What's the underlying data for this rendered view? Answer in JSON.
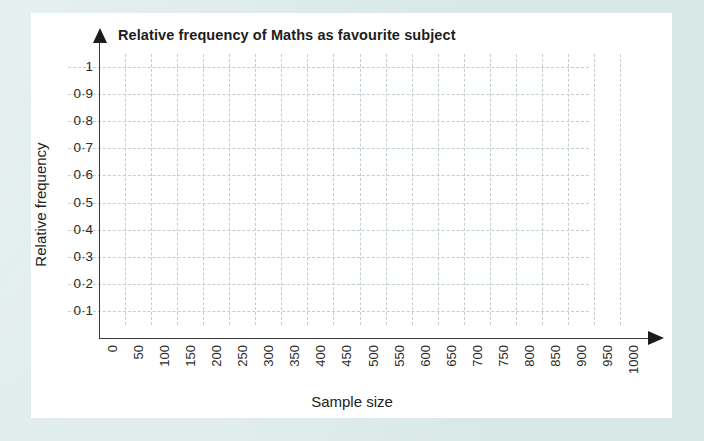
{
  "canvas": {
    "width": 704,
    "height": 441,
    "backdrop_color": "#d7e8e6",
    "card_color": "#ffffff"
  },
  "chart_data": {
    "type": "line",
    "title": "Relative frequency of Maths as favourite subject",
    "xlabel": "Sample size",
    "ylabel": "Relative frequency",
    "x": [],
    "values": [],
    "series": [],
    "xlim": [
      0,
      1000
    ],
    "ylim": [
      0,
      1
    ],
    "xticks": [
      0,
      50,
      100,
      150,
      200,
      250,
      300,
      350,
      400,
      450,
      500,
      550,
      600,
      650,
      700,
      750,
      800,
      850,
      900,
      950,
      1000
    ],
    "xtick_labels": [
      "0",
      "50",
      "100",
      "150",
      "200",
      "250",
      "300",
      "350",
      "400",
      "450",
      "500",
      "550",
      "600",
      "650",
      "700",
      "750",
      "800",
      "850",
      "900",
      "950",
      "1000"
    ],
    "yticks": [
      0.1,
      0.2,
      0.3,
      0.4,
      0.5,
      0.6,
      0.7,
      0.8,
      0.9,
      1.0
    ],
    "ytick_labels": [
      "0·1",
      "0·2",
      "0·3",
      "0·4",
      "0·5",
      "0·6",
      "0·7",
      "0·8",
      "0·9",
      "1"
    ],
    "grid": true,
    "grid_style": "dashed",
    "grid_color": "#c2cdd4",
    "legend": null,
    "axis_color": "#3a3a3a",
    "note": "Empty grid / blank axes — no data plotted",
    "x_axis_arrow": true,
    "y_axis_arrow": true,
    "xtick_label_rotation": 90
  },
  "icons": {
    "y_axis_arrow": "arrow-up-icon",
    "x_axis_arrow": "arrow-right-icon"
  }
}
